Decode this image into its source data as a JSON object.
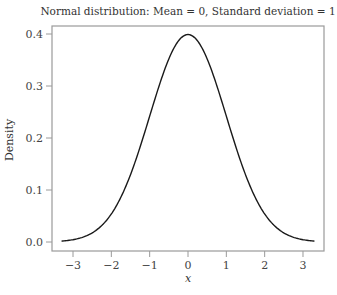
{
  "chart_data": {
    "type": "line",
    "title": "Normal distribution: Mean = 0, Standard deviation = 1",
    "xlabel": "x",
    "ylabel": "Density",
    "xlim": [
      -3.3,
      3.3
    ],
    "ylim": [
      0.0,
      0.4
    ],
    "xticks": [
      -3,
      -2,
      -1,
      0,
      1,
      2,
      3
    ],
    "xtick_labels": [
      "−3",
      "−2",
      "−1",
      "0",
      "1",
      "2",
      "3"
    ],
    "yticks": [
      0.0,
      0.1,
      0.2,
      0.3,
      0.4
    ],
    "ytick_labels": [
      "0.0",
      "0.1",
      "0.2",
      "0.3",
      "0.4"
    ],
    "grid": false,
    "legend": null,
    "series": [
      {
        "name": "Normal density (mean 0, sd 1)",
        "mean": 0,
        "sd": 1,
        "x": [
          -3.3,
          -3.0,
          -2.5,
          -2.0,
          -1.5,
          -1.0,
          -0.5,
          0.0,
          0.5,
          1.0,
          1.5,
          2.0,
          2.5,
          3.0,
          3.3
        ],
        "y": [
          0.0017,
          0.0044,
          0.0175,
          0.054,
          0.1295,
          0.242,
          0.3521,
          0.3989,
          0.3521,
          0.242,
          0.1295,
          0.054,
          0.0175,
          0.0044,
          0.0017
        ]
      }
    ]
  },
  "colors": {
    "curve": "#1a1a1a",
    "frame": "#9a9a9a",
    "text": "#333333"
  }
}
